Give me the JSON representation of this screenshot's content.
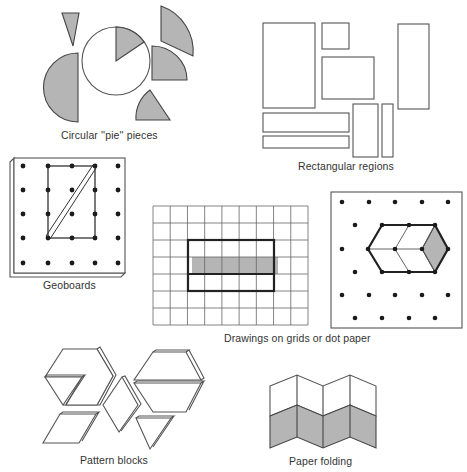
{
  "figure": {
    "colors": {
      "shade": "#b5b5b5",
      "stroke": "#555555",
      "dot": "#1a1a1a",
      "background": "#ffffff"
    },
    "panels": [
      {
        "id": "pie",
        "label": "Circular ''pie'' pieces"
      },
      {
        "id": "rectangles",
        "label": "Rectangular regions"
      },
      {
        "id": "geoboard",
        "label": "Geoboards"
      },
      {
        "id": "grid-dot",
        "label": "Drawings on grids or dot paper"
      },
      {
        "id": "pattern-blocks",
        "label": "Pattern blocks"
      },
      {
        "id": "paper-folding",
        "label": "Paper folding"
      }
    ],
    "grid": {
      "columns": 9,
      "rows": 7,
      "highlight_cols": [
        2,
        7
      ],
      "highlight_rows": [
        2,
        5
      ],
      "shaded_row": 4
    },
    "geoboard": {
      "pegs_per_side": 5
    },
    "paper_folding": {
      "panels": 4,
      "shaded_half": "bottom"
    }
  }
}
